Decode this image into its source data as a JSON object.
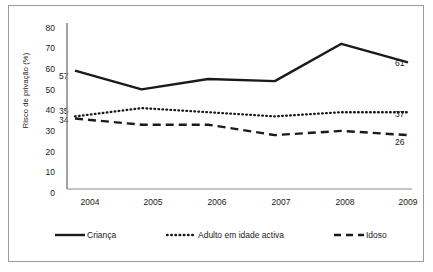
{
  "chart_data": {
    "type": "line",
    "title": "",
    "xlabel": "",
    "ylabel": "Risco de privação (%)",
    "categories": [
      "2004",
      "2005",
      "2006",
      "2007",
      "2008",
      "2009"
    ],
    "ylim": [
      0,
      80
    ],
    "ytick_labels": [
      "80",
      "70",
      "60",
      "50",
      "40",
      "30",
      "20",
      "10",
      "0"
    ],
    "ytick_values": [
      80,
      70,
      60,
      50,
      40,
      30,
      20,
      10,
      0
    ],
    "grid": false,
    "legend_position": "bottom",
    "series": [
      {
        "name": "Criança",
        "style": "solid",
        "color": "#1a1a1a",
        "values": [
          57,
          48,
          53,
          52,
          70,
          61
        ],
        "start_label": "57",
        "end_label": "61"
      },
      {
        "name": "Adulto em idade activa",
        "style": "dotted",
        "color": "#1a1a1a",
        "values": [
          35,
          39,
          37,
          35,
          37,
          37
        ],
        "start_label": "35",
        "end_label": "37"
      },
      {
        "name": "Idoso",
        "style": "dashed",
        "color": "#1a1a1a",
        "values": [
          34,
          31,
          31,
          26,
          28,
          26
        ],
        "start_label": "34",
        "end_label": "26"
      }
    ],
    "annotations": {
      "left_labels": [
        "57",
        "35",
        "34"
      ],
      "right_labels": [
        "61",
        "37",
        "26"
      ]
    }
  }
}
